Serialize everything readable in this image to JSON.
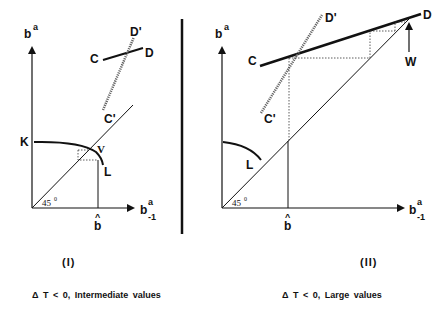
{
  "panels": [
    {
      "id": "I",
      "y_axis_label": "b",
      "y_axis_sup": "a",
      "x_axis_label": "b",
      "x_axis_sup": "a",
      "x_axis_sub": "-1",
      "angle_label": "45",
      "angle_sup": "0",
      "bhat_label": "b",
      "bhat_hat": "^",
      "labels": {
        "K": "K",
        "V": "V",
        "L": "L",
        "C": "C",
        "D": "D",
        "C_prime": "C'",
        "D_prime": "D'"
      },
      "caption_number": "(I)",
      "caption_text": "Δ  T  <  0,  Intermediate  values"
    },
    {
      "id": "II",
      "y_axis_label": "b",
      "y_axis_sup": "a",
      "x_axis_label": "b",
      "x_axis_sup": "a",
      "x_axis_sub": "-1",
      "angle_label": "45",
      "angle_sup": "0",
      "bhat_label": "b",
      "bhat_hat": "^",
      "labels": {
        "L": "L",
        "C": "C",
        "D": "D",
        "W": "W",
        "C_prime": "C'",
        "D_prime": "D'"
      },
      "caption_number": "(II)",
      "caption_text": "Δ  T  <  0,  Large  values"
    }
  ],
  "colors": {
    "ink": "#111111",
    "background": "#ffffff",
    "dashed": "#555555"
  }
}
